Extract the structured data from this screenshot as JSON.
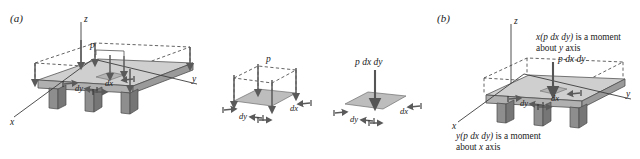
{
  "figure": {
    "caption_panels": [
      {
        "id": "a",
        "label": "(a)"
      },
      {
        "id": "b",
        "label": "(b)"
      }
    ],
    "background_color": "#ffffff",
    "ink_color": "#1a1a1a",
    "plate_fill": "#cfcfcf",
    "leg_fill": "#8e8e8e",
    "arrow_color": "#5a5a5a"
  },
  "panel_a": {
    "label": "(a)",
    "axes": {
      "z": "z",
      "y": "y",
      "x": "x"
    },
    "pressure_label": "p",
    "dim_dy": "dy",
    "dim_dx": "dx"
  },
  "sub_middle": {
    "pressure_label": "p",
    "dim_dy": "dy",
    "dim_dx": "dx"
  },
  "sub_right": {
    "force_label": "p dx dy",
    "dim_dy": "dy",
    "dim_dx": "dx"
  },
  "panel_b": {
    "label": "(b)",
    "axes": {
      "z": "z",
      "y": "y",
      "x": "x"
    },
    "force_label": "p dx dy",
    "dim_dy": "dy",
    "dim_dx": "dx",
    "moment_note_top": {
      "line1_math": "x(p dx dy)",
      "line1_text": " is a moment",
      "line2_text_a": "about ",
      "line2_math": "y",
      "line2_text_b": " axis"
    },
    "moment_note_bottom": {
      "line1_math": "y(p dx dy)",
      "line1_text": " is a moment",
      "line2_text_a": "about ",
      "line2_math": "x",
      "line2_text_b": " axis"
    }
  }
}
